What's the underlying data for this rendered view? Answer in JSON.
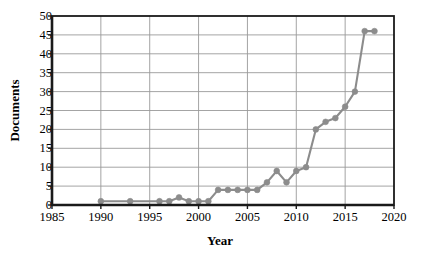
{
  "chart_data": {
    "type": "line",
    "title": "",
    "xlabel": "Year",
    "ylabel": "Documents",
    "xlim": [
      1985,
      2020
    ],
    "ylim": [
      0,
      50
    ],
    "xticks": [
      1985,
      1990,
      1995,
      2000,
      2005,
      2010,
      2015,
      2020
    ],
    "yticks": [
      0,
      5,
      10,
      15,
      20,
      25,
      30,
      35,
      40,
      45,
      50
    ],
    "grid": true,
    "legend": null,
    "series": [
      {
        "name": "Documents",
        "color": "#8c8c8c",
        "marker": "circle",
        "x": [
          1990,
          1993,
          1996,
          1997,
          1998,
          1999,
          2000,
          2001,
          2002,
          2003,
          2004,
          2005,
          2006,
          2007,
          2008,
          2009,
          2010,
          2011,
          2012,
          2013,
          2014,
          2015,
          2016,
          2017,
          2018
        ],
        "y": [
          1,
          1,
          1,
          1,
          2,
          1,
          1,
          1,
          4,
          4,
          4,
          4,
          4,
          6,
          9,
          6,
          9,
          10,
          20,
          22,
          23,
          26,
          30,
          46,
          46
        ]
      }
    ],
    "axis_color": "#1a1a1a",
    "grid_color": "#9a9a9a",
    "background": "#ffffff"
  },
  "ytick_labels": [
    "50",
    "45",
    "40",
    "35",
    "30",
    "25",
    "20",
    "15",
    "10",
    "5",
    "0"
  ],
  "xtick_labels": [
    "1985",
    "1990",
    "1995",
    "2000",
    "2005",
    "2010",
    "2015",
    "2020"
  ],
  "axis_titles": {
    "y": "Documents",
    "x": "Year"
  }
}
